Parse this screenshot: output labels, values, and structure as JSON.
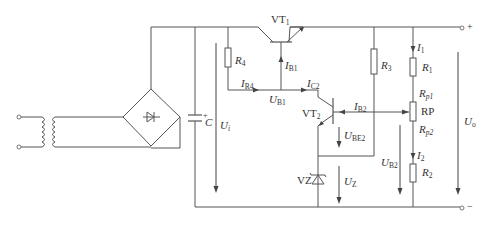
{
  "diagram": {
    "components": {
      "transformer": {
        "label": ""
      },
      "bridge_rectifier": {
        "label": ""
      },
      "capacitor": {
        "label": "C",
        "polarity": "+"
      },
      "vt1": {
        "label": "VT",
        "sub": "1"
      },
      "vt2": {
        "label": "VT",
        "sub": "2"
      },
      "r4": {
        "label": "R",
        "sub": "4"
      },
      "r3": {
        "label": "R",
        "sub": "3"
      },
      "r1": {
        "label": "R",
        "sub": "1"
      },
      "r2": {
        "label": "R",
        "sub": "2"
      },
      "rp": {
        "label": "RP"
      },
      "rp1": {
        "label": "R",
        "sub": "p1"
      },
      "rp2": {
        "label": "R",
        "sub": "p2"
      },
      "zener": {
        "label": "VZ"
      }
    },
    "currents": {
      "ib1": {
        "label": "I",
        "sub": "B1"
      },
      "ir4": {
        "label": "I",
        "sub": "R4"
      },
      "ic2": {
        "label": "I",
        "sub": "C2"
      },
      "ib2": {
        "label": "I",
        "sub": "B2"
      },
      "i1": {
        "label": "I",
        "sub": "1"
      },
      "i2": {
        "label": "I",
        "sub": "2"
      }
    },
    "voltages": {
      "ui": {
        "label": "U",
        "sub": "i"
      },
      "ub1": {
        "label": "U",
        "sub": "B1"
      },
      "ube2": {
        "label": "U",
        "sub": "BE2"
      },
      "uz": {
        "label": "U",
        "sub": "Z"
      },
      "ub2": {
        "label": "U",
        "sub": "B2"
      },
      "uo": {
        "label": "U",
        "sub": "o"
      }
    },
    "terminals": {
      "plus": "+",
      "minus": "−"
    }
  }
}
